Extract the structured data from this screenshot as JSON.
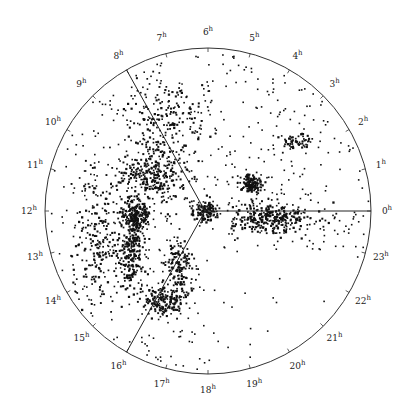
{
  "chart_data": {
    "type": "scatter",
    "projection": "polar (right ascension around the circle)",
    "title": "",
    "angular_axis": {
      "unit": "h",
      "tick_labels": [
        "0h",
        "1h",
        "2h",
        "3h",
        "4h",
        "5h",
        "6h",
        "7h",
        "8h",
        "9h",
        "10h",
        "11h",
        "12h",
        "13h",
        "14h",
        "15h",
        "16h",
        "17h",
        "18h",
        "19h",
        "20h",
        "21h",
        "22h",
        "23h"
      ],
      "zero_direction": "right",
      "direction": "counter-clockwise",
      "step_degrees": 15
    },
    "geometry": {
      "center": [
        208,
        211
      ],
      "radius": 163,
      "vertex": [
        205,
        211
      ]
    },
    "boundary_lines": [
      {
        "name": "0h-line",
        "to_hour": 0
      },
      {
        "name": "8h-line",
        "to_hour": 8
      },
      {
        "name": "16h-line",
        "to_hour": 16
      }
    ],
    "clusters": [
      {
        "name": "left-filament-upper",
        "cx": 150,
        "cy": 175,
        "rx": 30,
        "ry": 25,
        "n": 260
      },
      {
        "name": "left-dense-core",
        "cx": 135,
        "cy": 215,
        "rx": 14,
        "ry": 12,
        "n": 180
      },
      {
        "name": "left-vertical-spine",
        "cx": 130,
        "cy": 245,
        "rx": 12,
        "ry": 45,
        "n": 260
      },
      {
        "name": "left-outer-wall",
        "cx": 100,
        "cy": 240,
        "rx": 25,
        "ry": 60,
        "n": 220
      },
      {
        "name": "lower-filament",
        "cx": 160,
        "cy": 300,
        "rx": 18,
        "ry": 14,
        "n": 160
      },
      {
        "name": "lower-diagonal",
        "cx": 178,
        "cy": 265,
        "rx": 14,
        "ry": 30,
        "n": 140
      },
      {
        "name": "right-dense-core",
        "cx": 250,
        "cy": 183,
        "rx": 10,
        "ry": 8,
        "n": 140
      },
      {
        "name": "right-band",
        "cx": 270,
        "cy": 218,
        "rx": 40,
        "ry": 14,
        "n": 300
      },
      {
        "name": "right-upper-arc",
        "cx": 295,
        "cy": 140,
        "rx": 12,
        "ry": 6,
        "n": 50
      },
      {
        "name": "center-hub",
        "cx": 205,
        "cy": 210,
        "rx": 12,
        "ry": 10,
        "n": 120
      },
      {
        "name": "upper-left-wedge",
        "cx": 165,
        "cy": 120,
        "rx": 35,
        "ry": 45,
        "n": 200
      },
      {
        "name": "background-field",
        "cx": 208,
        "cy": 211,
        "rx": 160,
        "ry": 160,
        "n": 650
      }
    ],
    "legend": null,
    "grid": false
  },
  "ink_color": "#111111",
  "background_color": "#ffffff"
}
